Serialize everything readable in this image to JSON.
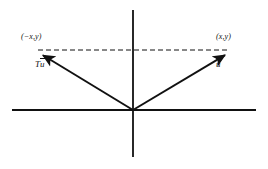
{
  "figure": {
    "kind": "math-diagram",
    "background_color": "#ffffff",
    "stroke_color": "#111111",
    "width": 268,
    "height": 169
  },
  "axes": {
    "x_axis": {
      "name": "horizontal-axis",
      "x1": 12,
      "y1": 110,
      "x2": 256,
      "y2": 110,
      "stroke_width": 1.8
    },
    "y_axis": {
      "name": "vertical-axis",
      "x1": 133,
      "y1": 10,
      "x2": 133,
      "y2": 157,
      "stroke_width": 1.8
    },
    "origin": {
      "x": 133,
      "y": 110
    }
  },
  "vectors": [
    {
      "id": "u",
      "label": "u",
      "label_has_vector_accent": true,
      "from": {
        "x": 133,
        "y": 110
      },
      "to": {
        "x": 232,
        "y": 51
      },
      "tip_point_label": "(x,y)",
      "stroke_width": 2.0,
      "label_position": {
        "x": 216,
        "y": 60
      }
    },
    {
      "id": "Tu",
      "label_prefix": "T",
      "label": "u",
      "label_has_vector_accent": true,
      "from": {
        "x": 133,
        "y": 110
      },
      "to": {
        "x": 36,
        "y": 51
      },
      "tip_point_label": "(−x,y)",
      "stroke_width": 2.0,
      "label_position": {
        "x": 35,
        "y": 60
      }
    }
  ],
  "dashed_connector": {
    "name": "dashed-connector-line",
    "x1": 38,
    "y1": 50,
    "x2": 230,
    "y2": 50,
    "dash_pattern": "5,3",
    "stroke_width": 1.0
  },
  "labels": {
    "point_left": "(−x,y)",
    "point_right": "(x,y)",
    "vector_left_prefix": "T",
    "vector_left_base": "u",
    "vector_right_base": "u"
  }
}
